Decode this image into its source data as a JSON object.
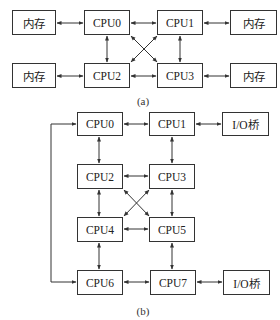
{
  "figure_a": {
    "caption": "(a)",
    "nodes": [
      {
        "id": "mem_a0",
        "label": "内存",
        "x": 12,
        "y": 10,
        "w": 44,
        "h": 25
      },
      {
        "id": "cpu_a0",
        "label": "CPU0",
        "x": 84,
        "y": 10,
        "w": 46,
        "h": 25
      },
      {
        "id": "cpu_a1",
        "label": "CPU1",
        "x": 157,
        "y": 10,
        "w": 46,
        "h": 25
      },
      {
        "id": "mem_a1",
        "label": "内存",
        "x": 230,
        "y": 10,
        "w": 47,
        "h": 25
      },
      {
        "id": "mem_a2",
        "label": "内存",
        "x": 12,
        "y": 63,
        "w": 44,
        "h": 25
      },
      {
        "id": "cpu_a2",
        "label": "CPU2",
        "x": 84,
        "y": 63,
        "w": 46,
        "h": 25
      },
      {
        "id": "cpu_a3",
        "label": "CPU3",
        "x": 157,
        "y": 63,
        "w": 46,
        "h": 25
      },
      {
        "id": "mem_a3",
        "label": "内存",
        "x": 230,
        "y": 63,
        "w": 47,
        "h": 25
      }
    ],
    "edges": [
      {
        "from": "mem_a0",
        "to": "cpu_a0",
        "path": [
          [
            57,
            23
          ],
          [
            83,
            23
          ]
        ]
      },
      {
        "from": "cpu_a0",
        "to": "cpu_a1",
        "path": [
          [
            131,
            23
          ],
          [
            156,
            23
          ]
        ]
      },
      {
        "from": "cpu_a1",
        "to": "mem_a1",
        "path": [
          [
            204,
            23
          ],
          [
            229,
            23
          ]
        ]
      },
      {
        "from": "mem_a2",
        "to": "cpu_a2",
        "path": [
          [
            57,
            76
          ],
          [
            83,
            76
          ]
        ]
      },
      {
        "from": "cpu_a2",
        "to": "cpu_a3",
        "path": [
          [
            131,
            76
          ],
          [
            156,
            76
          ]
        ]
      },
      {
        "from": "cpu_a3",
        "to": "mem_a3",
        "path": [
          [
            204,
            76
          ],
          [
            229,
            76
          ]
        ]
      },
      {
        "from": "cpu_a0",
        "to": "cpu_a2",
        "path": [
          [
            107,
            36
          ],
          [
            107,
            62
          ]
        ]
      },
      {
        "from": "cpu_a1",
        "to": "cpu_a3",
        "path": [
          [
            180,
            36
          ],
          [
            180,
            62
          ]
        ]
      },
      {
        "from": "cpu_a0",
        "to": "cpu_a3",
        "path": [
          [
            131,
            36
          ],
          [
            157,
            62
          ]
        ]
      },
      {
        "from": "cpu_a1",
        "to": "cpu_a2",
        "path": [
          [
            157,
            36
          ],
          [
            131,
            62
          ]
        ]
      }
    ],
    "caption_pos": {
      "x": 143,
      "y": 95
    }
  },
  "figure_b": {
    "caption": "(b)",
    "nodes": [
      {
        "id": "cpu_b0",
        "label": "CPU0",
        "x": 77,
        "y": 112,
        "w": 46,
        "h": 24
      },
      {
        "id": "cpu_b1",
        "label": "CPU1",
        "x": 149,
        "y": 112,
        "w": 46,
        "h": 24
      },
      {
        "id": "io_b0",
        "label": "I/O桥",
        "x": 222,
        "y": 112,
        "w": 47,
        "h": 24
      },
      {
        "id": "cpu_b2",
        "label": "CPU2",
        "x": 77,
        "y": 164,
        "w": 46,
        "h": 25
      },
      {
        "id": "cpu_b3",
        "label": "CPU3",
        "x": 149,
        "y": 164,
        "w": 46,
        "h": 25
      },
      {
        "id": "cpu_b4",
        "label": "CPU4",
        "x": 77,
        "y": 217,
        "w": 46,
        "h": 25
      },
      {
        "id": "cpu_b5",
        "label": "CPU5",
        "x": 149,
        "y": 217,
        "w": 46,
        "h": 25
      },
      {
        "id": "cpu_b6",
        "label": "CPU6",
        "x": 77,
        "y": 270,
        "w": 46,
        "h": 25
      },
      {
        "id": "cpu_b7",
        "label": "CPU7",
        "x": 150,
        "y": 270,
        "w": 46,
        "h": 25
      },
      {
        "id": "io_b1",
        "label": "I/O桥",
        "x": 223,
        "y": 270,
        "w": 47,
        "h": 25
      }
    ],
    "edges": [
      {
        "from": "cpu_b0",
        "to": "cpu_b1",
        "path": [
          [
            124,
            124
          ],
          [
            148,
            124
          ]
        ]
      },
      {
        "from": "cpu_b1",
        "to": "io_b0",
        "path": [
          [
            196,
            124
          ],
          [
            221,
            124
          ]
        ]
      },
      {
        "from": "cpu_b2",
        "to": "cpu_b3",
        "path": [
          [
            124,
            176
          ],
          [
            148,
            176
          ]
        ]
      },
      {
        "from": "cpu_b4",
        "to": "cpu_b5",
        "path": [
          [
            124,
            229
          ],
          [
            148,
            229
          ]
        ]
      },
      {
        "from": "cpu_b6",
        "to": "cpu_b7",
        "path": [
          [
            124,
            282
          ],
          [
            149,
            282
          ]
        ]
      },
      {
        "from": "cpu_b7",
        "to": "io_b1",
        "path": [
          [
            197,
            282
          ],
          [
            222,
            282
          ]
        ]
      },
      {
        "from": "cpu_b0",
        "to": "cpu_b2",
        "path": [
          [
            99,
            137
          ],
          [
            99,
            163
          ]
        ]
      },
      {
        "from": "cpu_b1",
        "to": "cpu_b3",
        "path": [
          [
            172,
            137
          ],
          [
            172,
            163
          ]
        ]
      },
      {
        "from": "cpu_b2",
        "to": "cpu_b4",
        "path": [
          [
            99,
            190
          ],
          [
            99,
            216
          ]
        ]
      },
      {
        "from": "cpu_b3",
        "to": "cpu_b5",
        "path": [
          [
            172,
            190
          ],
          [
            172,
            216
          ]
        ]
      },
      {
        "from": "cpu_b4",
        "to": "cpu_b6",
        "path": [
          [
            99,
            243
          ],
          [
            99,
            269
          ]
        ]
      },
      {
        "from": "cpu_b5",
        "to": "cpu_b7",
        "path": [
          [
            172,
            243
          ],
          [
            172,
            269
          ]
        ]
      },
      {
        "from": "cpu_b2",
        "to": "cpu_b5",
        "path": [
          [
            124,
            190
          ],
          [
            149,
            216
          ]
        ]
      },
      {
        "from": "cpu_b3",
        "to": "cpu_b4",
        "path": [
          [
            149,
            190
          ],
          [
            124,
            216
          ]
        ]
      },
      {
        "from": "cpu_b0",
        "to": "cpu_b6",
        "path": [
          [
            76,
            124
          ],
          [
            51,
            124
          ],
          [
            51,
            282
          ],
          [
            76,
            282
          ]
        ]
      }
    ],
    "caption_pos": {
      "x": 143,
      "y": 305
    }
  },
  "style": {
    "stroke": "#333333",
    "box_fill": "#ffffff",
    "text": "#222222"
  }
}
